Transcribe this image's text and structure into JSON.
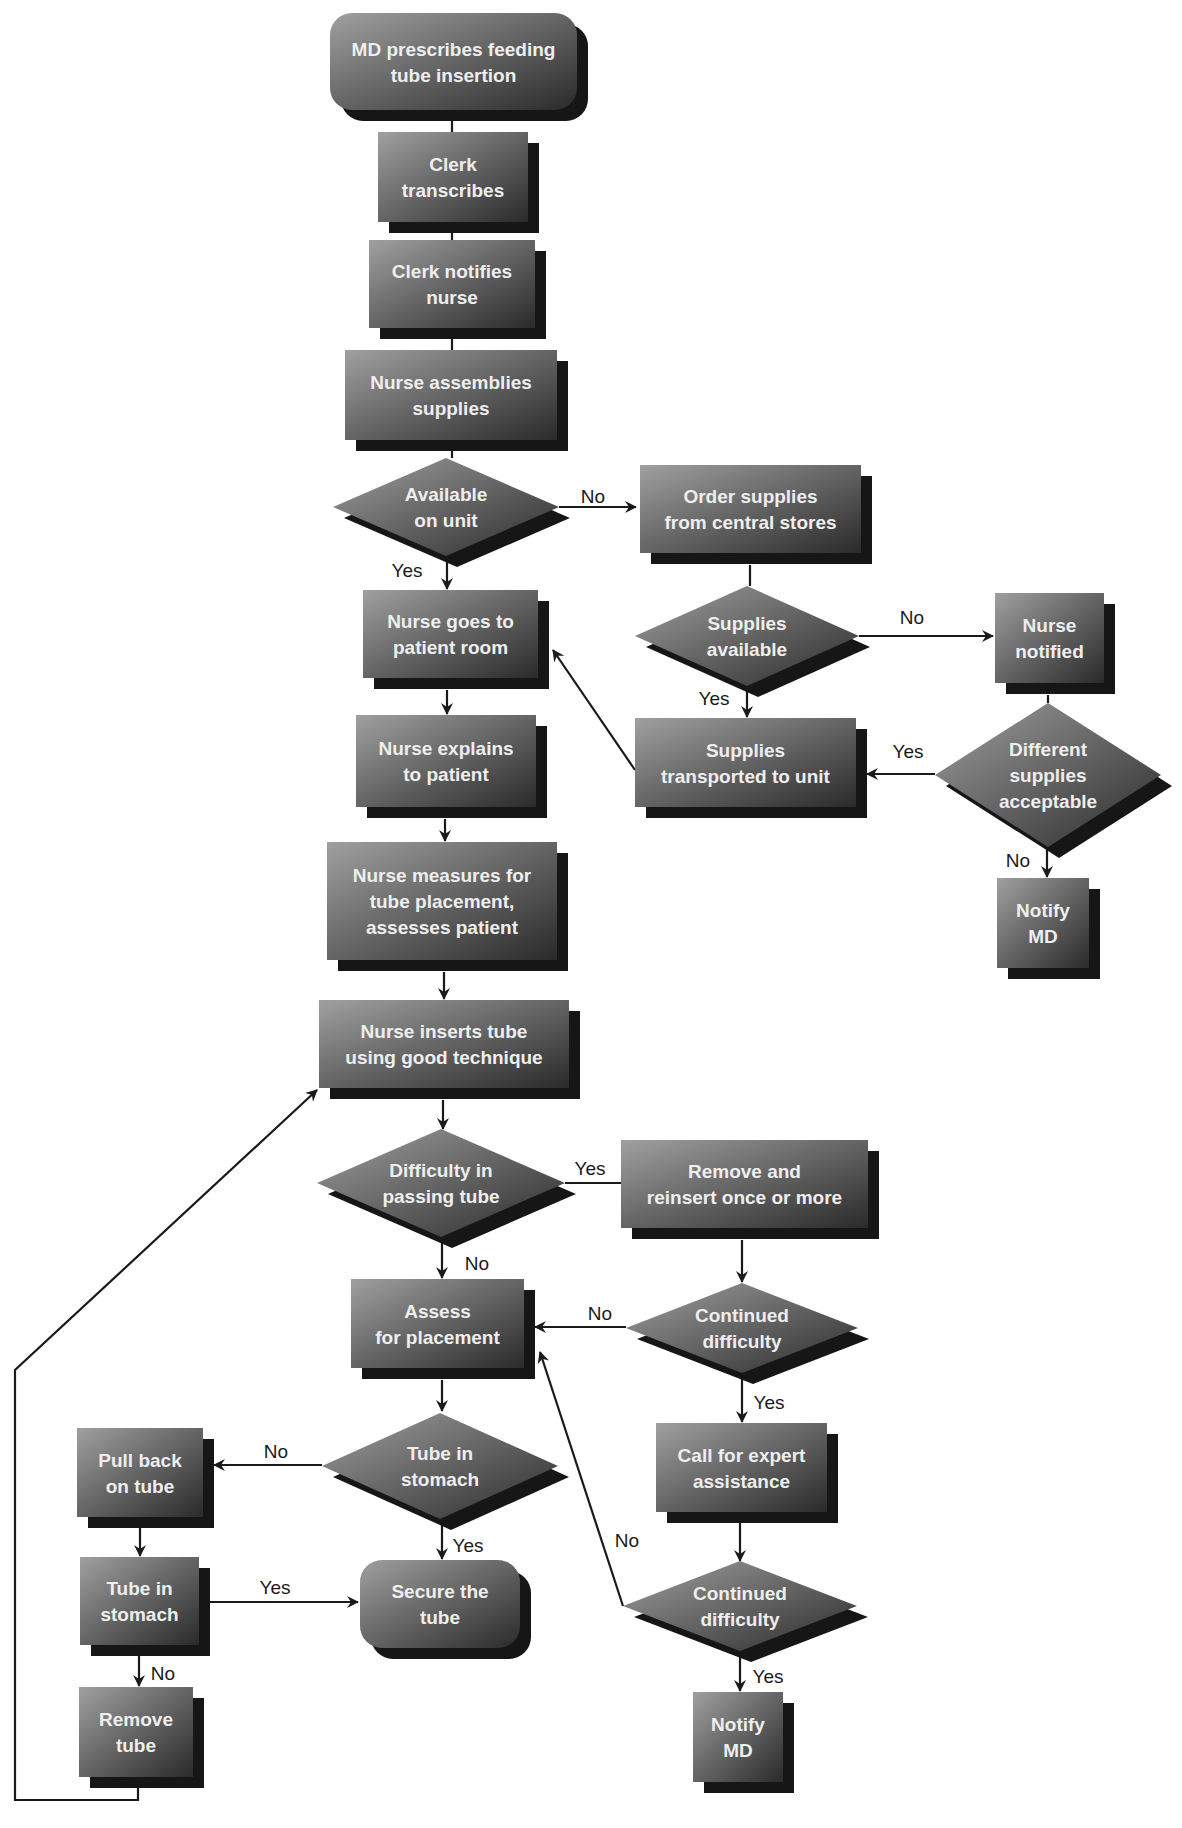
{
  "diagram": {
    "colors": {
      "background": "#ffffff",
      "shape_light": "#9a9a9a",
      "shape_dark": "#2e2e2e",
      "shadow": "#161616",
      "node_text": "#eeeeee",
      "line": "#1a1a1a"
    },
    "nodes": [
      {
        "id": "md-prescribes",
        "type": "terminal",
        "x": 330,
        "y": 13,
        "w": 247,
        "h": 97,
        "lines": [
          "MD prescribes feeding",
          "tube insertion"
        ]
      },
      {
        "id": "clerk-transcribes",
        "type": "process",
        "x": 378,
        "y": 132,
        "w": 150,
        "h": 90,
        "lines": [
          "Clerk",
          "transcribes"
        ]
      },
      {
        "id": "clerk-notifies-nurse",
        "type": "process",
        "x": 369,
        "y": 240,
        "w": 166,
        "h": 88,
        "lines": [
          "Clerk notifies",
          "nurse"
        ]
      },
      {
        "id": "nurse-assembles-supplies",
        "type": "process",
        "x": 345,
        "y": 350,
        "w": 212,
        "h": 90,
        "lines": [
          "Nurse assemblies",
          "supplies"
        ]
      },
      {
        "id": "available-on-unit",
        "type": "decision",
        "cx": 446,
        "cy": 507,
        "hw": 113,
        "hh": 49,
        "lines": [
          "Available",
          "on unit"
        ]
      },
      {
        "id": "order-supplies",
        "type": "process",
        "x": 640,
        "y": 465,
        "w": 221,
        "h": 88,
        "lines": [
          "Order supplies",
          "from central stores"
        ]
      },
      {
        "id": "supplies-available",
        "type": "decision",
        "cx": 747,
        "cy": 636,
        "hw": 112,
        "hh": 50,
        "lines": [
          "Supplies",
          "available"
        ]
      },
      {
        "id": "nurse-notified",
        "type": "process",
        "x": 995,
        "y": 593,
        "w": 109,
        "h": 90,
        "lines": [
          "Nurse",
          "notified"
        ]
      },
      {
        "id": "different-supplies-acceptable",
        "type": "decision",
        "cx": 1048,
        "cy": 775,
        "hw": 113,
        "hh": 72,
        "lines": [
          "Different",
          "supplies",
          "acceptable"
        ]
      },
      {
        "id": "notify-md-1",
        "type": "process",
        "x": 997,
        "y": 878,
        "w": 92,
        "h": 90,
        "lines": [
          "Notify",
          "MD"
        ]
      },
      {
        "id": "supplies-transported",
        "type": "process",
        "x": 635,
        "y": 718,
        "w": 221,
        "h": 89,
        "lines": [
          "Supplies",
          "transported to unit"
        ]
      },
      {
        "id": "nurse-goes-to-room",
        "type": "process",
        "x": 363,
        "y": 590,
        "w": 175,
        "h": 88,
        "lines": [
          "Nurse goes to",
          "patient room"
        ]
      },
      {
        "id": "nurse-explains",
        "type": "process",
        "x": 356,
        "y": 715,
        "w": 180,
        "h": 92,
        "lines": [
          "Nurse explains",
          "to patient"
        ]
      },
      {
        "id": "nurse-measures",
        "type": "process",
        "x": 327,
        "y": 842,
        "w": 230,
        "h": 118,
        "lines": [
          "Nurse measures for",
          "tube placement,",
          "assesses patient"
        ]
      },
      {
        "id": "nurse-inserts-tube",
        "type": "process",
        "x": 319,
        "y": 1000,
        "w": 250,
        "h": 88,
        "lines": [
          "Nurse inserts tube",
          "using good technique"
        ]
      },
      {
        "id": "difficulty-passing-tube",
        "type": "decision",
        "cx": 441,
        "cy": 1183,
        "hw": 124,
        "hh": 54,
        "lines": [
          "Difficulty in",
          "passing  tube"
        ]
      },
      {
        "id": "remove-and-reinsert",
        "type": "process",
        "x": 621,
        "y": 1140,
        "w": 247,
        "h": 88,
        "lines": [
          "Remove and",
          "reinsert once or more"
        ]
      },
      {
        "id": "assess-for-placement",
        "type": "process",
        "x": 351,
        "y": 1279,
        "w": 173,
        "h": 89,
        "lines": [
          "Assess",
          "for placement"
        ]
      },
      {
        "id": "continued-difficulty-1",
        "type": "decision",
        "cx": 742,
        "cy": 1328,
        "hw": 116,
        "hh": 45,
        "lines": [
          "Continued",
          "difficulty"
        ]
      },
      {
        "id": "call-for-expert",
        "type": "process",
        "x": 656,
        "y": 1423,
        "w": 171,
        "h": 89,
        "lines": [
          "Call for expert",
          "assistance"
        ]
      },
      {
        "id": "tube-in-stomach-1",
        "type": "decision",
        "cx": 440,
        "cy": 1466,
        "hw": 118,
        "hh": 53,
        "lines": [
          "Tube in",
          "stomach"
        ]
      },
      {
        "id": "pull-back-on-tube",
        "type": "process",
        "x": 77,
        "y": 1428,
        "w": 126,
        "h": 89,
        "lines": [
          "Pull back",
          "on tube"
        ]
      },
      {
        "id": "tube-in-stomach-2",
        "type": "process",
        "x": 80,
        "y": 1557,
        "w": 119,
        "h": 88,
        "lines": [
          "Tube in",
          "stomach"
        ]
      },
      {
        "id": "secure-the-tube",
        "type": "terminal",
        "x": 360,
        "y": 1560,
        "w": 160,
        "h": 88,
        "lines": [
          "Secure the",
          "tube"
        ]
      },
      {
        "id": "remove-tube",
        "type": "process",
        "x": 79,
        "y": 1687,
        "w": 114,
        "h": 90,
        "lines": [
          "Remove",
          "tube"
        ]
      },
      {
        "id": "continued-difficulty-2",
        "type": "decision",
        "cx": 740,
        "cy": 1606,
        "hw": 117,
        "hh": 45,
        "lines": [
          "Continued",
          "difficulty"
        ]
      },
      {
        "id": "notify-md-2",
        "type": "process",
        "x": 693,
        "y": 1692,
        "w": 90,
        "h": 90,
        "lines": [
          "Notify",
          "MD"
        ]
      }
    ],
    "edges": [
      {
        "id": "e1",
        "points": [
          [
            452,
            110
          ],
          [
            452,
            132
          ]
        ],
        "arrow": false
      },
      {
        "id": "e2",
        "points": [
          [
            452,
            222
          ],
          [
            452,
            240
          ]
        ],
        "arrow": false
      },
      {
        "id": "e3",
        "points": [
          [
            452,
            328
          ],
          [
            452,
            350
          ]
        ],
        "arrow": false
      },
      {
        "id": "e4",
        "points": [
          [
            452,
            440
          ],
          [
            452,
            458
          ]
        ],
        "arrow": false
      },
      {
        "id": "e5",
        "points": [
          [
            559,
            507
          ],
          [
            636,
            507
          ]
        ],
        "arrow": true
      },
      {
        "id": "e6",
        "points": [
          [
            447,
            556
          ],
          [
            447,
            589
          ]
        ],
        "arrow": true
      },
      {
        "id": "e7",
        "points": [
          [
            750,
            565
          ],
          [
            750,
            586
          ]
        ],
        "arrow": false
      },
      {
        "id": "e8",
        "points": [
          [
            859,
            636
          ],
          [
            993,
            636
          ]
        ],
        "arrow": true
      },
      {
        "id": "e9",
        "points": [
          [
            747,
            686
          ],
          [
            747,
            717
          ]
        ],
        "arrow": true
      },
      {
        "id": "e10",
        "points": [
          [
            1048,
            695
          ],
          [
            1048,
            703
          ]
        ],
        "arrow": false
      },
      {
        "id": "e11",
        "points": [
          [
            935,
            774
          ],
          [
            867,
            774
          ]
        ],
        "arrow": true
      },
      {
        "id": "e12",
        "points": [
          [
            1047,
            847
          ],
          [
            1047,
            877
          ]
        ],
        "arrow": true
      },
      {
        "id": "e13",
        "points": [
          [
            635,
            770
          ],
          [
            553,
            650
          ]
        ],
        "arrow": true
      },
      {
        "id": "e14",
        "points": [
          [
            447,
            690
          ],
          [
            447,
            714
          ]
        ],
        "arrow": true
      },
      {
        "id": "e15",
        "points": [
          [
            445,
            819
          ],
          [
            445,
            841
          ]
        ],
        "arrow": true
      },
      {
        "id": "e16",
        "points": [
          [
            444,
            972
          ],
          [
            444,
            999
          ]
        ],
        "arrow": true
      },
      {
        "id": "e17",
        "points": [
          [
            443,
            1100
          ],
          [
            443,
            1129
          ]
        ],
        "arrow": true
      },
      {
        "id": "e18",
        "points": [
          [
            565,
            1183
          ],
          [
            621,
            1183
          ]
        ],
        "arrow": false
      },
      {
        "id": "e19",
        "points": [
          [
            442,
            1238
          ],
          [
            442,
            1278
          ]
        ],
        "arrow": true
      },
      {
        "id": "e20",
        "points": [
          [
            742,
            1240
          ],
          [
            742,
            1282
          ]
        ],
        "arrow": true
      },
      {
        "id": "e21",
        "points": [
          [
            626,
            1327
          ],
          [
            535,
            1327
          ]
        ],
        "arrow": true
      },
      {
        "id": "e22",
        "points": [
          [
            742,
            1374
          ],
          [
            742,
            1422
          ]
        ],
        "arrow": true
      },
      {
        "id": "e23",
        "points": [
          [
            442,
            1380
          ],
          [
            442,
            1411
          ]
        ],
        "arrow": true
      },
      {
        "id": "e24",
        "points": [
          [
            322,
            1465
          ],
          [
            214,
            1465
          ]
        ],
        "arrow": true
      },
      {
        "id": "e25",
        "points": [
          [
            442,
            1520
          ],
          [
            442,
            1559
          ]
        ],
        "arrow": true
      },
      {
        "id": "e26",
        "points": [
          [
            140,
            1528
          ],
          [
            140,
            1556
          ]
        ],
        "arrow": true
      },
      {
        "id": "e27",
        "points": [
          [
            199,
            1602
          ],
          [
            358,
            1602
          ]
        ],
        "arrow": true
      },
      {
        "id": "e28",
        "points": [
          [
            139,
            1656
          ],
          [
            139,
            1686
          ]
        ],
        "arrow": true
      },
      {
        "id": "e29",
        "points": [
          [
            740,
            1523
          ],
          [
            740,
            1561
          ]
        ],
        "arrow": true
      },
      {
        "id": "e30",
        "points": [
          [
            623,
            1606
          ],
          [
            540,
            1352
          ]
        ],
        "arrow": true
      },
      {
        "id": "e31",
        "points": [
          [
            740,
            1651
          ],
          [
            740,
            1691
          ]
        ],
        "arrow": true
      },
      {
        "id": "e32",
        "points": [
          [
            138,
            1788
          ],
          [
            138,
            1800
          ],
          [
            15,
            1800
          ],
          [
            15,
            1370
          ],
          [
            317,
            1090
          ]
        ],
        "arrow": true
      }
    ],
    "edge_labels": [
      {
        "id": "l1",
        "text": "No",
        "x": 593,
        "y": 503
      },
      {
        "id": "l2",
        "text": "Yes",
        "x": 407,
        "y": 577
      },
      {
        "id": "l3",
        "text": "No",
        "x": 912,
        "y": 624
      },
      {
        "id": "l4",
        "text": "Yes",
        "x": 714,
        "y": 705
      },
      {
        "id": "l5",
        "text": "Yes",
        "x": 908,
        "y": 758
      },
      {
        "id": "l6",
        "text": "No",
        "x": 1018,
        "y": 867
      },
      {
        "id": "l7",
        "text": "Yes",
        "x": 590,
        "y": 1175
      },
      {
        "id": "l8",
        "text": "No",
        "x": 477,
        "y": 1270
      },
      {
        "id": "l9",
        "text": "No",
        "x": 600,
        "y": 1320
      },
      {
        "id": "l10",
        "text": "Yes",
        "x": 769,
        "y": 1409
      },
      {
        "id": "l11",
        "text": "No",
        "x": 276,
        "y": 1458
      },
      {
        "id": "l12",
        "text": "Yes",
        "x": 468,
        "y": 1552
      },
      {
        "id": "l13",
        "text": "No",
        "x": 627,
        "y": 1547
      },
      {
        "id": "l14",
        "text": "Yes",
        "x": 275,
        "y": 1594
      },
      {
        "id": "l15",
        "text": "No",
        "x": 163,
        "y": 1680
      },
      {
        "id": "l16",
        "text": "Yes",
        "x": 768,
        "y": 1683
      }
    ]
  }
}
